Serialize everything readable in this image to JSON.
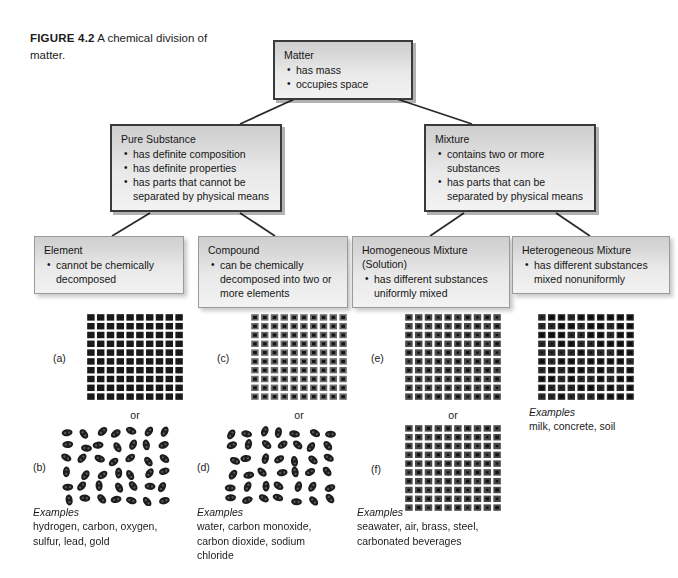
{
  "figure": {
    "label": "FIGURE 4.2",
    "caption": "A chemical division of matter."
  },
  "nodes": {
    "matter": {
      "title": "Matter",
      "bullets": [
        "has mass",
        "occupies space"
      ]
    },
    "pure_substance": {
      "title": "Pure Substance",
      "bullets": [
        "has definite composition",
        "has definite properties",
        "has parts that cannot be separated by physical means"
      ]
    },
    "mixture": {
      "title": "Mixture",
      "bullets": [
        "contains two or more substances",
        "has parts that can be separated by physical means"
      ]
    },
    "element": {
      "title": "Element",
      "bullets": [
        "cannot be chemically decomposed"
      ]
    },
    "compound": {
      "title": "Compound",
      "bullets": [
        "can be chemically decomposed into two or more elements"
      ]
    },
    "homogeneous": {
      "title": "Homogeneous Mixture\n(Solution)",
      "bullets": [
        "has different substances uniformly mixed"
      ]
    },
    "heterogeneous": {
      "title": "Heterogeneous Mixture",
      "bullets": [
        "has different substances mixed nonuniformly"
      ]
    }
  },
  "art": {
    "or_label": "or",
    "panels": [
      {
        "tag": "(a)",
        "kind": "uniform-squares"
      },
      {
        "tag": "(b)",
        "kind": "random-blobs"
      },
      {
        "tag": "(c)",
        "kind": "compound-squares"
      },
      {
        "tag": "(d)",
        "kind": "random-blobs"
      },
      {
        "tag": "(e)",
        "kind": "mixed-squares"
      },
      {
        "tag": "(f)",
        "kind": "mixed-squares"
      },
      {
        "tag": "",
        "kind": "hetero-squares"
      }
    ]
  },
  "examples": {
    "heading": "Examples",
    "element": "hydrogen, carbon, oxygen,\nsulfur, lead, gold",
    "compound": "water, carbon monoxide,\ncarbon dioxide, sodium\nchloride",
    "homogeneous": "seawater, air, brass, steel,\ncarbonated beverages",
    "heterogeneous": "milk, concrete, soil"
  },
  "colors": {
    "box_fill_top": "#cfcfcf",
    "box_fill_bottom": "#f2f2f2",
    "box_border_dark": "#3a3a3a",
    "box_border_light": "#9a9a9a",
    "connector": "#2b2b2b",
    "particle_dark": "#1a1a1a",
    "page_background": "#ffffff"
  }
}
